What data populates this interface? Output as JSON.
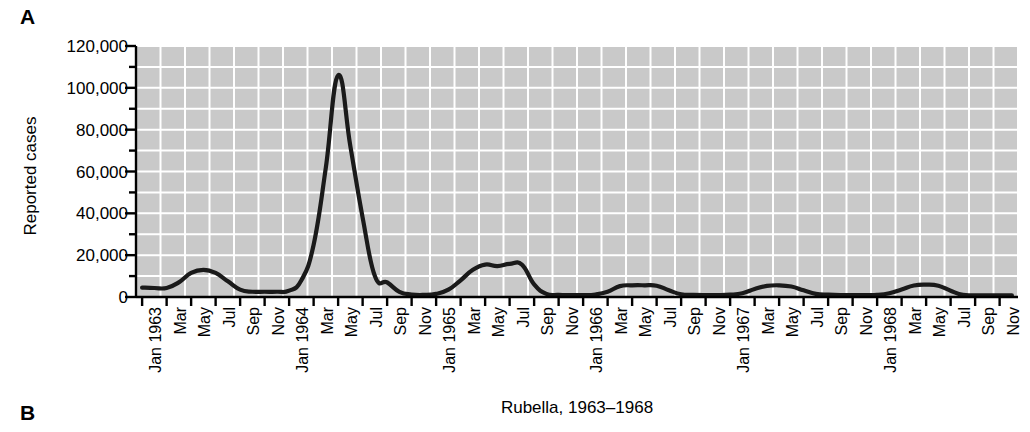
{
  "panels": {
    "a_label": "A",
    "b_label": "B"
  },
  "chart_data": {
    "type": "line",
    "title": "Rubella, 1963–1968",
    "xlabel": "",
    "ylabel": "Reported cases",
    "ylim": [
      0,
      120000
    ],
    "ytick_labels": [
      "0",
      "20,000",
      "40,000",
      "60,000",
      "80,000",
      "100,000",
      "120,000"
    ],
    "ytick_values": [
      0,
      20000,
      40000,
      60000,
      80000,
      100000,
      120000
    ],
    "minor_ytick_interval": 10000,
    "grid": true,
    "grid_color": "#ffffff",
    "plot_background": "#c9c9c9",
    "line_color": "#1a1a1a",
    "legend": null,
    "legend_position": "none",
    "x_major_labels": [
      "Jan 1963",
      "Jan 1964",
      "Jan 1965",
      "Jan 1966",
      "Jan 1967",
      "Jan 1968"
    ],
    "categories": [
      "Jan 1963",
      "Feb 1963",
      "Mar 1963",
      "Apr 1963",
      "May 1963",
      "Jun 1963",
      "Jul 1963",
      "Aug 1963",
      "Sep 1963",
      "Oct 1963",
      "Nov 1963",
      "Dec 1963",
      "Jan 1964",
      "Feb 1964",
      "Mar 1964",
      "Apr 1964",
      "May 1964",
      "Jun 1964",
      "Jul 1964",
      "Aug 1964",
      "Sep 1964",
      "Oct 1964",
      "Nov 1964",
      "Dec 1964",
      "Jan 1965",
      "Feb 1965",
      "Mar 1965",
      "Apr 1965",
      "May 1965",
      "Jun 1965",
      "Jul 1965",
      "Aug 1965",
      "Sep 1965",
      "Oct 1965",
      "Nov 1965",
      "Dec 1965",
      "Jan 1966",
      "Feb 1966",
      "Mar 1966",
      "Apr 1966",
      "May 1966",
      "Jun 1966",
      "Jul 1966",
      "Aug 1966",
      "Sep 1966",
      "Oct 1966",
      "Nov 1966",
      "Dec 1966",
      "Jan 1967",
      "Feb 1967",
      "Mar 1967",
      "Apr 1967",
      "May 1967",
      "Jun 1967",
      "Jul 1967",
      "Aug 1967",
      "Sep 1967",
      "Oct 1967",
      "Nov 1967",
      "Dec 1967",
      "Jan 1968",
      "Feb 1968",
      "Mar 1968",
      "Apr 1968",
      "May 1968",
      "Jun 1968",
      "Jul 1968",
      "Aug 1968",
      "Sep 1968",
      "Oct 1968",
      "Nov 1968",
      "Dec 1968"
    ],
    "x_tick_labels": [
      {
        "index": 0,
        "text": "Jan 1963",
        "major": true
      },
      {
        "index": 2,
        "text": "Mar",
        "major": false
      },
      {
        "index": 4,
        "text": "May",
        "major": false
      },
      {
        "index": 6,
        "text": "Jul",
        "major": false
      },
      {
        "index": 8,
        "text": "Sep",
        "major": false
      },
      {
        "index": 10,
        "text": "Nov",
        "major": false
      },
      {
        "index": 12,
        "text": "Jan 1964",
        "major": true
      },
      {
        "index": 14,
        "text": "Mar",
        "major": false
      },
      {
        "index": 16,
        "text": "May",
        "major": false
      },
      {
        "index": 18,
        "text": "Jul",
        "major": false
      },
      {
        "index": 20,
        "text": "Sep",
        "major": false
      },
      {
        "index": 22,
        "text": "Nov",
        "major": false
      },
      {
        "index": 24,
        "text": "Jan 1965",
        "major": true
      },
      {
        "index": 26,
        "text": "Mar",
        "major": false
      },
      {
        "index": 28,
        "text": "May",
        "major": false
      },
      {
        "index": 30,
        "text": "Jul",
        "major": false
      },
      {
        "index": 32,
        "text": "Sep",
        "major": false
      },
      {
        "index": 34,
        "text": "Nov",
        "major": false
      },
      {
        "index": 36,
        "text": "Jan 1966",
        "major": true
      },
      {
        "index": 38,
        "text": "Mar",
        "major": false
      },
      {
        "index": 40,
        "text": "May",
        "major": false
      },
      {
        "index": 42,
        "text": "Jul",
        "major": false
      },
      {
        "index": 44,
        "text": "Sep",
        "major": false
      },
      {
        "index": 46,
        "text": "Nov",
        "major": false
      },
      {
        "index": 48,
        "text": "Jan 1967",
        "major": true
      },
      {
        "index": 50,
        "text": "Mar",
        "major": false
      },
      {
        "index": 52,
        "text": "May",
        "major": false
      },
      {
        "index": 54,
        "text": "Jul",
        "major": false
      },
      {
        "index": 56,
        "text": "Sep",
        "major": false
      },
      {
        "index": 58,
        "text": "Nov",
        "major": false
      },
      {
        "index": 60,
        "text": "Jan 1968",
        "major": true
      },
      {
        "index": 62,
        "text": "Mar",
        "major": false
      },
      {
        "index": 64,
        "text": "May",
        "major": false
      },
      {
        "index": 66,
        "text": "Jul",
        "major": false
      },
      {
        "index": 68,
        "text": "Sep",
        "major": false
      },
      {
        "index": 70,
        "text": "Nov",
        "major": false
      }
    ],
    "values": [
      4500,
      4300,
      4300,
      7000,
      11500,
      13000,
      11500,
      7500,
      3500,
      2500,
      2500,
      2500,
      3000,
      8000,
      25000,
      62000,
      106000,
      72000,
      38000,
      10000,
      7000,
      2500,
      1200,
      1000,
      1500,
      3500,
      8000,
      13000,
      15500,
      14800,
      15800,
      15500,
      6000,
      1500,
      1000,
      900,
      900,
      1200,
      2500,
      5200,
      5600,
      5600,
      5400,
      3200,
      1300,
      1000,
      900,
      900,
      1100,
      1800,
      3800,
      5300,
      5600,
      5000,
      3200,
      1500,
      1100,
      900,
      900,
      900,
      1000,
      1800,
      3600,
      5500,
      5900,
      5400,
      3000,
      1000,
      800,
      800,
      800,
      800
    ]
  }
}
